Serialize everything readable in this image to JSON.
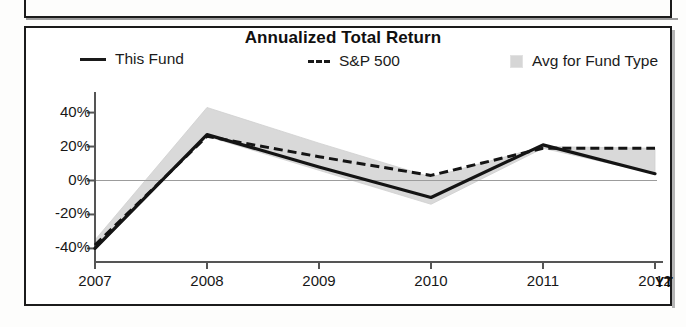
{
  "chart_data": {
    "type": "line",
    "title": "Annualized Total Return",
    "xlabel": "",
    "ylabel": "",
    "x": [
      "2007",
      "2008",
      "2009",
      "2010",
      "2011",
      "2012"
    ],
    "x_suffix_label": "YT",
    "xtick_labels": [
      "2007",
      "2008",
      "2009",
      "2010",
      "2011",
      "2012"
    ],
    "ytick_labels": [
      "40%",
      "20%",
      "0%",
      "-20%",
      "-40%"
    ],
    "ytick_values": [
      40,
      20,
      0,
      -20,
      -40
    ],
    "ylim": [
      -48,
      48
    ],
    "grid": false,
    "zero_line": true,
    "legend_position": "top",
    "series": [
      {
        "name": "This Fund",
        "style": "solid",
        "color": "#141414",
        "values": [
          -40,
          27,
          8,
          -10,
          21,
          4
        ]
      },
      {
        "name": "S&P 500",
        "style": "dashed",
        "color": "#141414",
        "values": [
          -38,
          26,
          14,
          3,
          19,
          19
        ]
      },
      {
        "name": "Avg for Fund Type",
        "style": "band",
        "color": "#d9d9d9",
        "upper": [
          -35,
          43,
          22,
          2,
          20,
          19
        ],
        "lower": [
          -41,
          26,
          6,
          -14,
          19,
          4
        ]
      }
    ]
  },
  "legend": {
    "items": [
      {
        "label": "This Fund",
        "swatch": "solid-line-swatch"
      },
      {
        "label": "S&P 500",
        "swatch": "dashed-line-swatch"
      },
      {
        "label": "Avg for Fund Type",
        "swatch": "shaded-area-swatch"
      }
    ]
  },
  "colors": {
    "line": "#141414",
    "band_fill": "#d9d9d9",
    "axis": "#555555",
    "frame": "#1b1b1b",
    "text": "#111111"
  }
}
